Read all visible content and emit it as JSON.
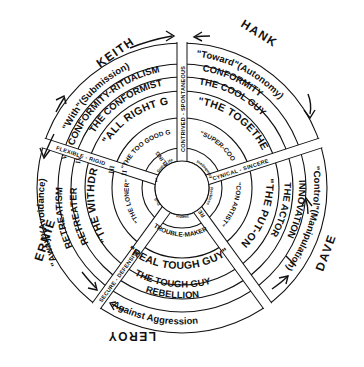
{
  "diagram": {
    "type": "concentric-circle-typology",
    "center": [
      182,
      188
    ],
    "quadrants": [
      {
        "person": "KEITH",
        "orientation": "\"With\"(Submission)",
        "rings": [
          "CONFORMITY-RITUALISM",
          "THE CONFORMIST",
          "\"ALL RIGHT GUY\"",
          "\"THE TOO GOOD GUY\""
        ]
      },
      {
        "person": "HANK",
        "orientation": "\"Toward\"(Autonomy)",
        "rings": [
          "CONFORMITY",
          "THE COOL GUY",
          "\"THE TOGETHER GUY\"",
          "\"SUPER-COOL CAT\""
        ]
      },
      {
        "person": "DAVE",
        "orientation": "\"Control\"(Manipulation)",
        "rings": [
          "INNOVATION",
          "THE ACTOR",
          "\"THE PUT-ON\"",
          "\"CON ARTIST\""
        ]
      },
      {
        "person": "LEROY",
        "orientation": "Against Aggression",
        "rings": [
          "REBELLION",
          "THE TOUGH GUY",
          "\"REAL TOUGH GUY\"",
          "TROUBLE-MAKER"
        ]
      },
      {
        "person": "ERNIE",
        "orientation": "\"Away\"(Avoidance)",
        "rings": [
          "RETREATISM",
          "RETREATER",
          "\"THE WITHDRAWN KID\"",
          "\"THE LONER\""
        ]
      }
    ],
    "spokes": [
      {
        "label": "CONTRIVED - SPONTANEOUS"
      },
      {
        "label": "CYNICAL - SINCERE"
      },
      {
        "label": "REVEALING - CONCEALING"
      },
      {
        "label": "SECURE - DEFENSIVE"
      },
      {
        "label": "FLEXIBLE - RIGID"
      }
    ],
    "ring_numerals": [
      "I",
      "II",
      "III",
      "IV",
      "V"
    ],
    "inner_labels": [
      "Good Life",
      "Violent",
      "Inadequacy",
      "Reckless",
      "Dull"
    ]
  }
}
